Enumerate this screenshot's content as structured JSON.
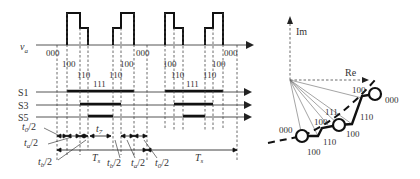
{
  "timing": {
    "signal_label_v": "v",
    "signal_label_sub": "a",
    "switch_labels": [
      "S1",
      "S3",
      "S5"
    ],
    "states_period1": [
      "000",
      "100",
      "110",
      "111",
      "110",
      "100",
      "000"
    ],
    "states_period2": [
      "000",
      "100",
      "110",
      "111",
      "110",
      "100",
      "000"
    ],
    "interval_labels": {
      "t0": "t",
      "t0_sub": "0",
      "half": "/2",
      "ta": "t",
      "ta_sub": "a",
      "tb": "t",
      "tb_sub": "b",
      "t7": "t",
      "t7_sub": "7",
      "Ts": "T",
      "Ts_sub": "s"
    }
  },
  "vector": {
    "im_label": "Im",
    "re_label": "Re",
    "states": [
      "000",
      "100",
      "100",
      "111",
      "110",
      "100",
      "110",
      "100",
      "000"
    ]
  }
}
